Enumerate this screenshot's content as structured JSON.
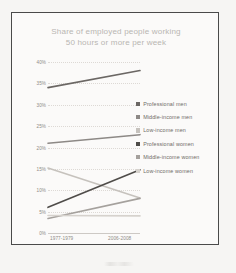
{
  "chart_data": {
    "type": "line",
    "title": "Share of employed people working 50 hours or more per week",
    "title_line1": "Share of employed people working",
    "title_line2": "50 hours or more per week",
    "xlabel": "",
    "ylabel": "",
    "x": [
      "1977-1979",
      "2006-2008"
    ],
    "categories": [
      "1977-1979",
      "2006-2008"
    ],
    "ylim": [
      0,
      40
    ],
    "yticks": [
      0,
      5,
      10,
      15,
      20,
      25,
      30,
      35,
      40
    ],
    "ytick_labels": [
      "0%",
      "5%",
      "10%",
      "15%",
      "20%",
      "25%",
      "30%",
      "35%",
      "40%"
    ],
    "grid": true,
    "legend_position": "right",
    "series": [
      {
        "name": "Professional men",
        "values": [
          34.0,
          38.0
        ],
        "color": "#6b6764"
      },
      {
        "name": "Middle-income men",
        "values": [
          21.0,
          23.0
        ],
        "color": "#8d8986"
      },
      {
        "name": "Low-income men",
        "values": [
          15.2,
          8.2
        ],
        "color": "#c6c2bd"
      },
      {
        "name": "Professional women",
        "values": [
          6.0,
          14.8
        ],
        "color": "#4f4c49"
      },
      {
        "name": "Middle-income women",
        "values": [
          3.4,
          8.1
        ],
        "color": "#a5a19d"
      },
      {
        "name": "Low-income women",
        "values": [
          4.1,
          4.0
        ],
        "color": "#d6d2cd"
      }
    ]
  },
  "legend": {
    "items": [
      {
        "label": "Professional men"
      },
      {
        "label": "Middle-income men"
      },
      {
        "label": "Low-income men"
      },
      {
        "label": "Professional women"
      },
      {
        "label": "Middle-income women"
      },
      {
        "label": "Low-income women"
      }
    ]
  },
  "colors": {
    "page_background": "#f6f5f3",
    "frame_border": "#4a4a4a",
    "plot_background": "#fbfaf9",
    "title_text": "#b9b6b2",
    "axis_text": "#8e8a86",
    "legend_text": "#6f6b67",
    "gridline": "#ddd9d5"
  }
}
